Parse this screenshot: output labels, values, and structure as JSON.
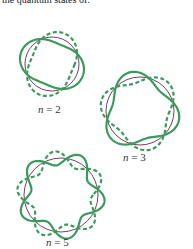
{
  "caption": "the quantum states of:",
  "colors": {
    "wave": "#3a9a5c",
    "circle": "#6b2a4a"
  },
  "diagrams": [
    {
      "n": 2,
      "label_var": "n",
      "label_eq": " = 2",
      "cx": 52,
      "cy": 64,
      "r": 27,
      "amp": 6
    },
    {
      "n": 3,
      "label_var": "n",
      "label_eq": " = 3",
      "cx": 140,
      "cy": 111,
      "r": 34,
      "amp": 6
    },
    {
      "n": 5,
      "label_var": "n",
      "label_eq": " = 5",
      "cx": 61,
      "cy": 195,
      "r": 37,
      "amp": 7
    }
  ]
}
